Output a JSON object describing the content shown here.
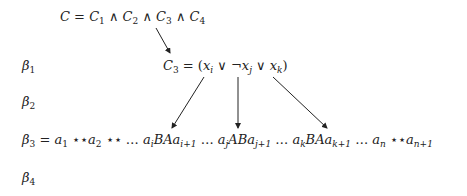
{
  "formula": {
    "C": "C",
    "eq": " = ",
    "clauses": [
      "C",
      "1",
      "C",
      "2",
      "C",
      "3",
      "C",
      "4"
    ],
    "and": " ∧ "
  },
  "clause": {
    "lhs": "C",
    "lhs_sub": "3",
    "rhs_prefix": " = (",
    "x": "x",
    "i": "i",
    "or": " ∨ ",
    "not": "¬",
    "j": "j",
    "k": "k",
    "close": ")"
  },
  "labels": {
    "beta": "β",
    "b1": "1",
    "b2": "2",
    "b3": "3",
    "b4": "4"
  },
  "string": {
    "eq": " = ",
    "a": "a",
    "stars": " ⋆⋆",
    "dots": " … ",
    "s1": "1",
    "s2": "2",
    "si": "i",
    "si1": "i+1",
    "sj": "j",
    "sj1": "j+1",
    "sk": "k",
    "sk1": "k+1",
    "sn": "n",
    "sn1": "n+1",
    "BA": "BA",
    "AB": "AB"
  }
}
